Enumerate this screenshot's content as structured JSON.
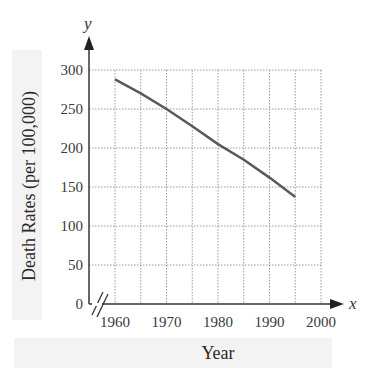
{
  "chart_data": {
    "type": "line",
    "title": "",
    "xlabel": "Year",
    "ylabel": "Death Rates (per 100,000)",
    "x_axis_var": "x",
    "y_axis_var": "y",
    "x_ticks": [
      "1960",
      "1970",
      "1980",
      "1990",
      "2000"
    ],
    "y_ticks": [
      "0",
      "50",
      "100",
      "150",
      "200",
      "250",
      "300"
    ],
    "xlim": [
      1955,
      2000
    ],
    "ylim": [
      0,
      300
    ],
    "grid": true,
    "axis_break_x": true,
    "series": [
      {
        "name": "Death Rate",
        "x": [
          1960,
          1965,
          1970,
          1975,
          1980,
          1985,
          1990,
          1995
        ],
        "values": [
          288,
          270,
          250,
          228,
          205,
          185,
          162,
          137
        ],
        "color": "#5a5a5a"
      }
    ]
  },
  "colors": {
    "axis": "#333333",
    "grid": "#9a9a9a",
    "line": "#5a5a5a",
    "label_band": "#f2f2f2"
  }
}
